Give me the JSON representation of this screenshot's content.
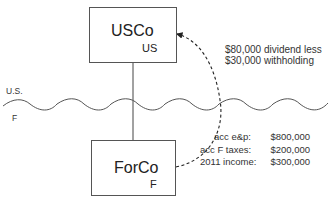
{
  "diagram": {
    "parent": {
      "name": "USCo",
      "jurisdiction": "US"
    },
    "subsidiary": {
      "name": "ForCo",
      "jurisdiction": "F"
    },
    "border": {
      "upper_label": "U.S.",
      "lower_label": "F"
    },
    "distribution": {
      "line1": "$80,000 dividend less",
      "line2": "$30,000 withholding"
    },
    "forco_facts": [
      {
        "label": "acc e&p:",
        "value": "$800,000"
      },
      {
        "label": "acc F taxes:",
        "value": "$200,000"
      },
      {
        "label": "2011 income:",
        "value": "$300,000"
      }
    ]
  }
}
